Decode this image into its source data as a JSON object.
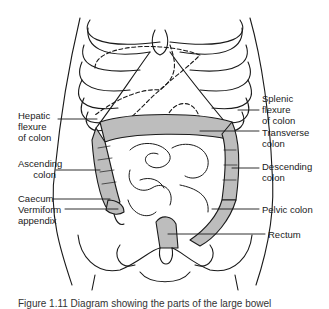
{
  "figure": {
    "type": "anatomical diagram",
    "colors": {
      "line": "#1a1a1a",
      "colon_fill": "#bdbdbd",
      "background": "#ffffff"
    }
  },
  "labels": {
    "hepatic_flexure": "Hepatic\nflexure\nof colon",
    "splenic_flexure": "Splenic\nflexure\nof colon",
    "transverse_colon": "Transverse\ncolon",
    "ascending_colon": "Ascending\ncolon",
    "descending_colon": "Descending\ncolon",
    "caecum": "Caecum",
    "vermiform_appendix": "Vermiform\nappendix",
    "pelvic_colon": "Pelvic colon",
    "rectum": "Rectum"
  },
  "caption": "Figure 1.11  Diagram showing the parts of the large bowel"
}
